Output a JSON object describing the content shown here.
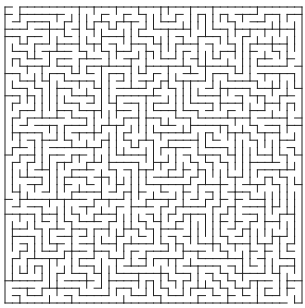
{
  "maze": {
    "rows": 40,
    "cols": 40,
    "origin_x": 5,
    "origin_y": 7,
    "width": 297,
    "height": 296,
    "wall_color": "#222222",
    "background": "#ffffff",
    "wall_width": 1,
    "entrance": {
      "side": "top",
      "col": 1
    },
    "exit": {
      "side": "bottom",
      "col": 38
    }
  }
}
